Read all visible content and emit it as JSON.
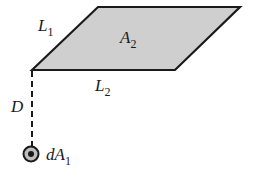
{
  "diagram": {
    "type": "geometry-view-factor",
    "colors": {
      "surface_fill": "#cfcfcf",
      "stroke": "#1a1a1a",
      "background": "#ffffff"
    },
    "surface": {
      "name": "A",
      "subscript": "2",
      "vertices": [
        [
          32,
          70
        ],
        [
          98,
          7
        ],
        [
          240,
          7
        ],
        [
          175,
          70
        ]
      ]
    },
    "edges": {
      "L1": {
        "name": "L",
        "subscript": "1"
      },
      "L2": {
        "name": "L",
        "subscript": "2"
      }
    },
    "distance": {
      "name": "D"
    },
    "element": {
      "name": "dA",
      "subscript": "1"
    }
  }
}
